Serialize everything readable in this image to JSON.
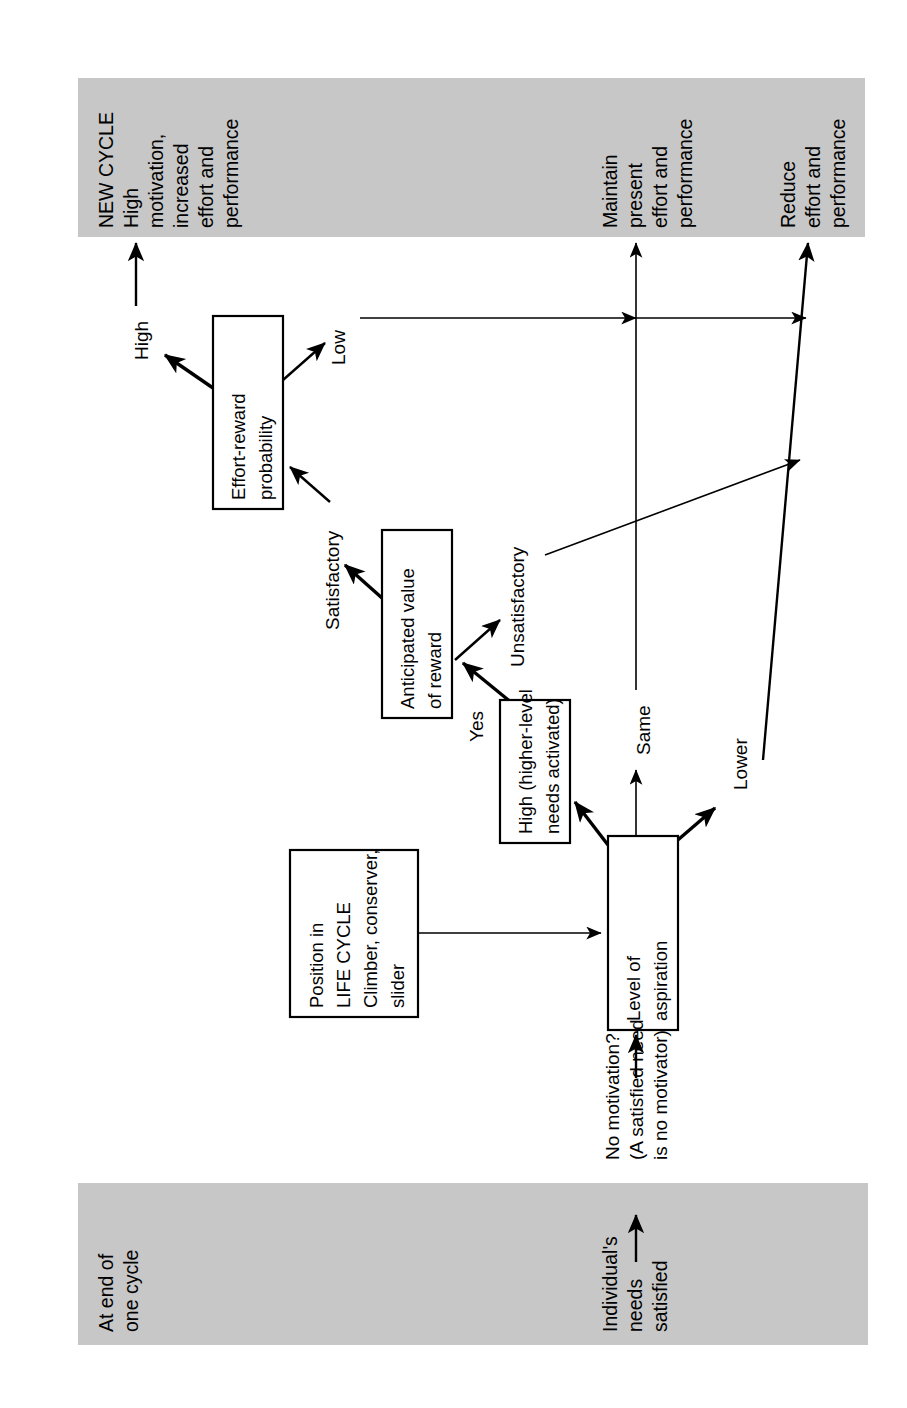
{
  "diagram": {
    "orientation": "rotated-90-ccw",
    "colors": {
      "band_fill": "#c7c7c7",
      "box_fill": "#ffffff",
      "stroke": "#000000"
    },
    "bands": [
      {
        "id": "new-cycle-band",
        "labels": [
          {
            "id": "new-cycle",
            "lines": [
              "NEW CYCLE",
              "High",
              "motivation,",
              "increased",
              "effort and",
              "performance"
            ]
          },
          {
            "id": "maintain",
            "lines": [
              "Maintain",
              "present",
              "effort and",
              "performance"
            ]
          },
          {
            "id": "reduce",
            "lines": [
              "Reduce",
              "effort and",
              "performance"
            ]
          }
        ]
      },
      {
        "id": "end-of-cycle-band",
        "labels": [
          {
            "id": "at-end-of-cycle",
            "lines": [
              "At end of",
              "one cycle"
            ]
          },
          {
            "id": "individual-needs",
            "lines": [
              "Individual's",
              "needs",
              "satisfied"
            ]
          }
        ]
      }
    ],
    "nodes": [
      {
        "id": "effort-reward-probability",
        "lines": [
          "Effort-reward",
          "probability"
        ]
      },
      {
        "id": "anticipated-value-of-reward",
        "lines": [
          "Anticipated value",
          "of reward"
        ]
      },
      {
        "id": "high-higher-level-needs",
        "lines": [
          "High (higher-level",
          "needs activated)"
        ]
      },
      {
        "id": "level-of-aspiration",
        "lines": [
          "Level of",
          "aspiration"
        ]
      },
      {
        "id": "position-in-life-cycle",
        "lines": [
          "Position in",
          "LIFE CYCLE",
          "Climber, conserver,",
          "slider"
        ]
      }
    ],
    "edge_labels": [
      {
        "id": "high",
        "text": "High"
      },
      {
        "id": "low",
        "text": "Low"
      },
      {
        "id": "satisfactory",
        "text": "Satisfactory"
      },
      {
        "id": "unsatisfactory",
        "text": "Unsatisfactory"
      },
      {
        "id": "yes",
        "text": "Yes"
      },
      {
        "id": "same",
        "text": "Same"
      },
      {
        "id": "lower",
        "text": "Lower"
      },
      {
        "id": "no-motivation",
        "lines": [
          "No motivation?",
          "(A satisfied need",
          "is no motivator)"
        ]
      }
    ]
  }
}
